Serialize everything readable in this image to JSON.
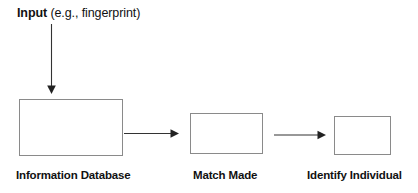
{
  "diagram": {
    "type": "flowchart",
    "orientation": "left-to-right",
    "title": {
      "strong_text": "Input",
      "rest_text": " (e.g., fingerprint)",
      "full_text": "Input (e.g., fingerprint)"
    },
    "colors": {
      "background": "#ffffff",
      "box_border": "#8a8a8a",
      "box_fill": "#ffffff",
      "arrow": "#333333",
      "text": "#111111"
    },
    "nodes": [
      {
        "id": "information-database",
        "label": "Information Database",
        "shape": "rectangle"
      },
      {
        "id": "match-made",
        "label": "Match Made",
        "shape": "rectangle"
      },
      {
        "id": "identify-individual",
        "label": "Identify Individual",
        "shape": "rectangle"
      }
    ],
    "edges": [
      {
        "id": "input-to-database",
        "from": "input-label",
        "to": "information-database",
        "direction": "down",
        "label": ""
      },
      {
        "id": "database-to-match",
        "from": "information-database",
        "to": "match-made",
        "direction": "right",
        "label": ""
      },
      {
        "id": "match-to-identify",
        "from": "match-made",
        "to": "identify-individual",
        "direction": "right",
        "label": ""
      }
    ]
  }
}
